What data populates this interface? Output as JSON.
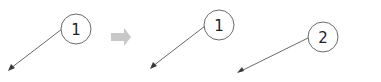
{
  "diagram": {
    "colors": {
      "circle_stroke": "#6a6a6a",
      "leader_line": "#6a6a6a",
      "transition_arrow": "#c8c8c8",
      "text": "#222222"
    },
    "before": {
      "callouts": [
        {
          "label": "1"
        }
      ]
    },
    "transition": {
      "icon": "right-arrow-icon"
    },
    "after": {
      "callouts": [
        {
          "label": "1"
        },
        {
          "label": "2"
        }
      ]
    }
  }
}
